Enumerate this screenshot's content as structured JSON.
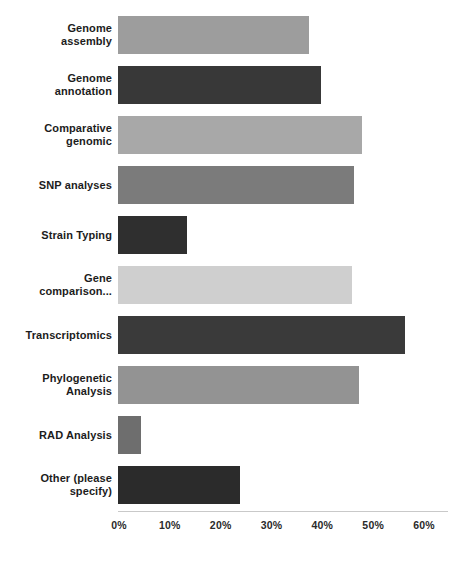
{
  "chart_data": {
    "type": "bar",
    "orientation": "horizontal",
    "title": "",
    "xlabel": "",
    "ylabel": "",
    "xlim": [
      0,
      60
    ],
    "xticks": [
      0,
      10,
      20,
      30,
      40,
      50,
      60
    ],
    "xtick_labels": [
      "0%",
      "10%",
      "20%",
      "30%",
      "40%",
      "50%",
      "60%"
    ],
    "grid": false,
    "legend": "none",
    "value_unit": "%",
    "categories": [
      "Genome assembly",
      "Genome annotation",
      "Comparative genomic",
      "SNP analyses",
      "Strain Typing",
      "Gene comparison...",
      "Transcriptomics",
      "Phylogenetic Analysis",
      "RAD Analysis",
      "Other (please specify)"
    ],
    "values": [
      37.5,
      40,
      48,
      46.5,
      13.5,
      46,
      56.5,
      47.5,
      4.5,
      24
    ],
    "bar_colors": [
      "#9d9d9d",
      "#383838",
      "#a8a8a8",
      "#7b7b7b",
      "#2f2f2f",
      "#cfcfcf",
      "#3a3a3a",
      "#939393",
      "#6e6e6e",
      "#2b2b2b"
    ]
  },
  "labels": {
    "rows": [
      {
        "lines": [
          "Genome",
          "assembly"
        ]
      },
      {
        "lines": [
          "Genome",
          "annotation"
        ]
      },
      {
        "lines": [
          "Comparative",
          "genomic"
        ]
      },
      {
        "lines": [
          "SNP analyses"
        ]
      },
      {
        "lines": [
          "Strain Typing"
        ]
      },
      {
        "lines": [
          "Gene",
          "comparison..."
        ]
      },
      {
        "lines": [
          "Transcriptomics"
        ]
      },
      {
        "lines": [
          "Phylogenetic",
          "Analysis"
        ]
      },
      {
        "lines": [
          "RAD Analysis"
        ]
      },
      {
        "lines": [
          "Other (please",
          "specify)"
        ]
      }
    ]
  }
}
